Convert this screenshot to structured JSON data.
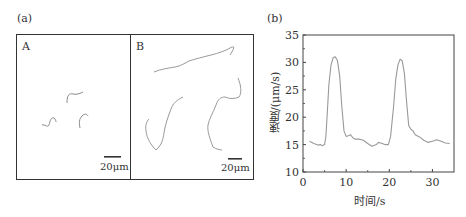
{
  "figure": {
    "panel_a": {
      "label": "(a)",
      "subpanels": [
        {
          "label": "A",
          "scale_bar": "20μm"
        },
        {
          "label": "B",
          "scale_bar": "20μm"
        }
      ]
    },
    "panel_b": {
      "label": "(b)"
    }
  },
  "chart_data": {
    "type": "line",
    "title": "",
    "xlabel": "时间/s",
    "ylabel": "速度/(μm/s)",
    "xlim": [
      0,
      35
    ],
    "ylim": [
      10,
      35
    ],
    "xticks": [
      0,
      10,
      20,
      30
    ],
    "yticks": [
      10,
      15,
      20,
      25,
      30,
      35
    ],
    "grid": false,
    "legend": null,
    "line_color": "#999999",
    "series": [
      {
        "name": "speed",
        "x": [
          1.5,
          2.5,
          3.5,
          4.0,
          4.5,
          5.0,
          5.3,
          5.6,
          6.0,
          6.5,
          7.0,
          7.5,
          8.0,
          8.5,
          9.0,
          9.5,
          10.0,
          10.5,
          11.0,
          11.5,
          12.0,
          13.0,
          14.0,
          15.0,
          16.0,
          17.0,
          17.5,
          18.0,
          19.0,
          19.8,
          20.3,
          21.0,
          21.5,
          22.0,
          22.5,
          23.0,
          23.5,
          24.0,
          24.5,
          25.0,
          25.5,
          26.0,
          27.0,
          28.0,
          29.0,
          30.0,
          31.0,
          32.0,
          33.0,
          34.0
        ],
        "y": [
          15.6,
          15.2,
          14.9,
          15.0,
          14.8,
          15.0,
          16.5,
          20.5,
          26.0,
          29.5,
          30.9,
          31.0,
          30.3,
          27.5,
          22.0,
          17.5,
          16.5,
          16.6,
          16.8,
          16.3,
          16.0,
          16.0,
          15.8,
          15.2,
          14.7,
          15.0,
          15.4,
          15.3,
          15.0,
          15.0,
          16.5,
          22.0,
          27.0,
          29.5,
          30.6,
          30.3,
          28.0,
          23.0,
          18.5,
          17.8,
          17.5,
          16.8,
          16.4,
          15.8,
          15.4,
          15.6,
          15.9,
          15.6,
          15.3,
          15.2
        ]
      }
    ]
  }
}
